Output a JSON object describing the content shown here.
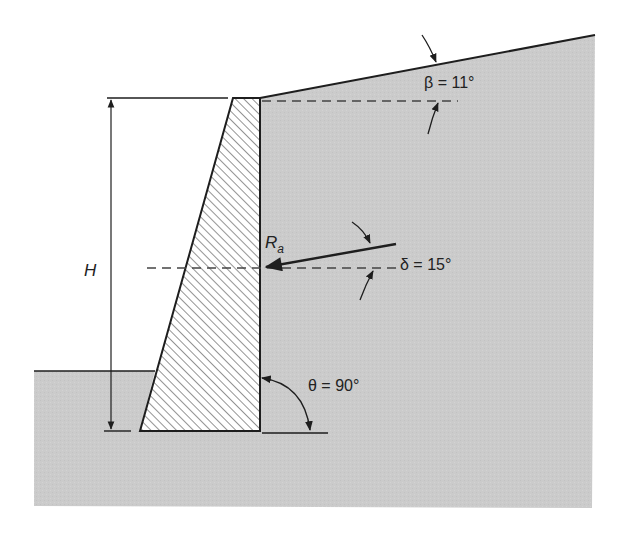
{
  "diagram": {
    "colors": {
      "soil": "#cbcbcb",
      "line": "#1e1e1e",
      "hatch": "#3a3a3a",
      "background": "#ffffff"
    },
    "labels": {
      "height": "H",
      "force_main": "R",
      "force_sub": "a",
      "beta": "β = 11°",
      "delta": "δ = 15°",
      "theta": "θ = 90°"
    },
    "parameters": {
      "beta_deg": 11,
      "delta_deg": 15,
      "theta_deg": 90
    }
  }
}
